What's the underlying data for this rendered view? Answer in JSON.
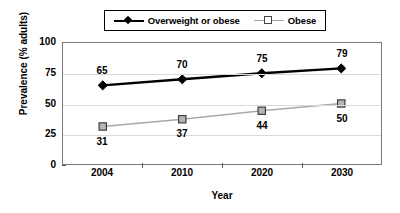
{
  "chart_data": {
    "type": "line",
    "title": "",
    "xlabel": "Year",
    "ylabel": "Prevalence (% adults)",
    "categories": [
      "2004",
      "2010",
      "2020",
      "2030"
    ],
    "ylim": [
      0,
      100
    ],
    "yticks": [
      "0",
      "25",
      "50",
      "75",
      "100"
    ],
    "grid": "horizontal",
    "legend_position": "top-center",
    "series": [
      {
        "name": "Overweight or obese",
        "values": [
          65,
          70,
          75,
          79
        ],
        "labels": [
          "65",
          "70",
          "75",
          "79"
        ],
        "label_position": "above",
        "color": "#000000",
        "marker": "diamond",
        "marker_fill": "#000000"
      },
      {
        "name": "Obese",
        "values": [
          31,
          37,
          44,
          50
        ],
        "labels": [
          "31",
          "37",
          "44",
          "50"
        ],
        "label_position": "below",
        "color": "#a8a8a8",
        "marker": "square",
        "marker_fill": "#b5b5b5"
      }
    ]
  },
  "legend": {
    "entries": [
      {
        "label": "Overweight or obese"
      },
      {
        "label": "Obese"
      }
    ]
  },
  "axes": {
    "y_label": "Prevalence (% adults)",
    "x_label": "Year"
  }
}
